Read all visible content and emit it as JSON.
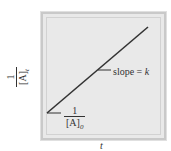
{
  "figure": {
    "type": "integrated second-order rate law plot",
    "y_axis_label": {
      "numerator": "1",
      "denominator": "[A]",
      "subscript": "t"
    },
    "x_axis_label": "t",
    "intercept_label": {
      "numerator": "1",
      "denominator": "[A]",
      "subscript": "0"
    },
    "slope_label": {
      "prefix": "slope = ",
      "symbol": "k"
    },
    "colors": {
      "panel": "#e9e9e9",
      "border": "#c9c9c9",
      "line": "#333333"
    },
    "line": {
      "x1": 47,
      "y1": 113,
      "x2": 148,
      "y2": 27
    }
  }
}
